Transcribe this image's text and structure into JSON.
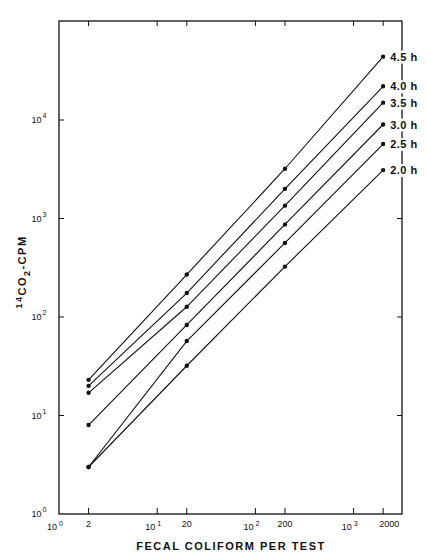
{
  "chart_data": {
    "type": "line",
    "title": "",
    "xlabel": "FECAL COLIFORM PER TEST",
    "ylabel": "14CO2-CPM",
    "ylabel_parts": {
      "sup": "14",
      "main": "CO",
      "sub": "2",
      "rest": "-CPM"
    },
    "xscale": "log",
    "yscale": "log",
    "xlim": [
      1,
      3160
    ],
    "ylim": [
      1,
      100000
    ],
    "grid": false,
    "legend_position": "inline-right",
    "x_ticks": [
      {
        "value": 1,
        "base": "10",
        "exp": "0"
      },
      {
        "value": 10,
        "base": "10",
        "exp": "1"
      },
      {
        "value": 100,
        "base": "10",
        "exp": "2"
      },
      {
        "value": 1000,
        "base": "10",
        "exp": "3"
      }
    ],
    "x_value_ticks": [
      {
        "value": 2,
        "label": "2"
      },
      {
        "value": 20,
        "label": "20"
      },
      {
        "value": 200,
        "label": "200"
      },
      {
        "value": 2000,
        "label": "2000"
      }
    ],
    "y_ticks": [
      {
        "value": 1,
        "base": "10",
        "exp": "0"
      },
      {
        "value": 10,
        "base": "10",
        "exp": "1"
      },
      {
        "value": 100,
        "base": "10",
        "exp": "2"
      },
      {
        "value": 1000,
        "base": "10",
        "exp": "3"
      },
      {
        "value": 10000,
        "base": "10",
        "exp": "4"
      }
    ],
    "x": [
      2,
      20,
      200,
      2000
    ],
    "series": [
      {
        "name": "4.5 h",
        "values": [
          23,
          270,
          3200,
          44000
        ]
      },
      {
        "name": "4.0 h",
        "values": [
          20,
          175,
          2000,
          22000
        ]
      },
      {
        "name": "3.5 h",
        "values": [
          17,
          127,
          1350,
          15000
        ]
      },
      {
        "name": "3.0 h",
        "values": [
          8,
          83,
          870,
          9000
        ]
      },
      {
        "name": "2.5 h",
        "values": [
          3,
          57,
          565,
          5700
        ]
      },
      {
        "name": "2.0 h",
        "values": [
          3,
          32,
          325,
          3100
        ]
      }
    ]
  },
  "colors": {
    "ink": "#111111",
    "background": "#ffffff"
  }
}
